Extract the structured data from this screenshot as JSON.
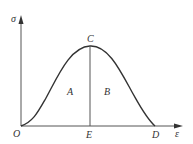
{
  "diagram": {
    "type": "stress-strain curve",
    "axes": {
      "y_label": "σ",
      "x_label": "ε"
    },
    "points": {
      "origin": "O",
      "peak": "C",
      "foot": "E",
      "end": "D"
    },
    "regions": {
      "left": "A",
      "right": "B"
    },
    "colors": {
      "line": "#333333",
      "background": "#ffffff"
    }
  }
}
